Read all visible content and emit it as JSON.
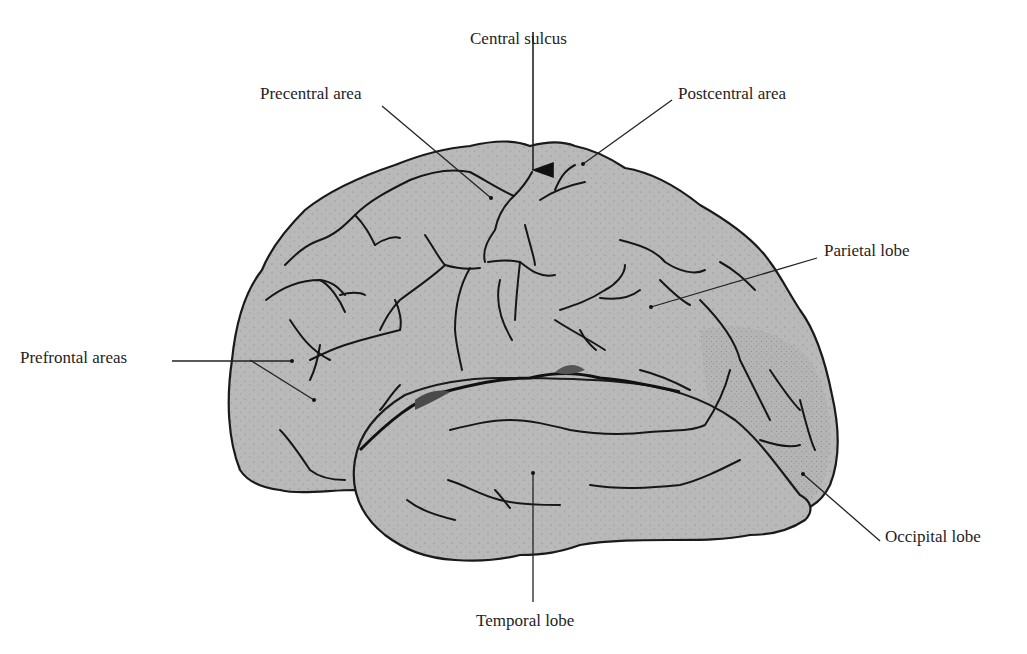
{
  "figure": {
    "colors": {
      "background": "#ffffff",
      "brain_fill": "#b9b9b9",
      "outline": "#1a1a1a",
      "fissure_shadow": "#5a5a5a",
      "text": "#1e1e1e"
    },
    "labels": {
      "central_sulcus": "Central sulcus",
      "precentral_area": "Precentral area",
      "postcentral_area": "Postcentral area",
      "parietal_lobe": "Parietal lobe",
      "prefrontal_areas": "Prefrontal areas",
      "occipital_lobe": "Occipital lobe",
      "temporal_lobe": "Temporal lobe"
    }
  }
}
